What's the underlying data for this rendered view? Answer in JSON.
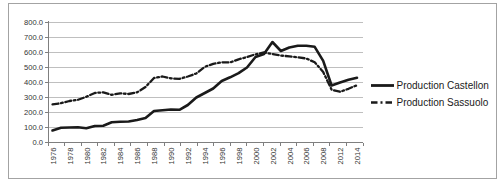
{
  "figure": {
    "background": "#ffffff",
    "border_color": "#a3a3a3"
  },
  "chart_data": {
    "type": "line",
    "title": "",
    "xlabel": "",
    "ylabel": "",
    "ylim": [
      0,
      800
    ],
    "ytick_step": 100,
    "ytick_labels": [
      "0.0",
      "100.0",
      "200.0",
      "300.0",
      "400.0",
      "500.0",
      "600.0",
      "700.0",
      "800.0"
    ],
    "grid": true,
    "legend_position": "right",
    "x_label_interval": 2,
    "categories": [
      "1976",
      "1977",
      "1978",
      "1979",
      "1980",
      "1981",
      "1982",
      "1983",
      "1984",
      "1985",
      "1986",
      "1987",
      "1988",
      "1989",
      "1990",
      "1991",
      "1992",
      "1993",
      "1994",
      "1995",
      "1996",
      "1997",
      "1998",
      "1999",
      "2000",
      "2001",
      "2002",
      "2003",
      "2004",
      "2005",
      "2006",
      "2007",
      "2008",
      "2009",
      "2012",
      "2013",
      "2014"
    ],
    "x_labels_visible": [
      "1976",
      "1978",
      "1980",
      "1982",
      "1984",
      "1986",
      "1988",
      "1990",
      "1992",
      "1994",
      "1996",
      "1998",
      "2000",
      "2002",
      "2004",
      "2006",
      "2008",
      "2012",
      "2014"
    ],
    "series": [
      {
        "name": "Production Castellon",
        "line_style": "solid",
        "color": "#1a1a1a",
        "values": [
          80,
          98,
          100,
          102,
          95,
          110,
          112,
          135,
          138,
          140,
          150,
          163,
          210,
          215,
          220,
          218,
          250,
          300,
          330,
          360,
          410,
          435,
          462,
          500,
          570,
          590,
          670,
          610,
          633,
          645,
          645,
          638,
          545,
          380,
          400,
          418,
          432
        ]
      },
      {
        "name": "Production Sassuolo",
        "line_style": "dash-dot",
        "color": "#1a1a1a",
        "values": [
          255,
          262,
          277,
          285,
          305,
          330,
          335,
          318,
          328,
          323,
          335,
          370,
          430,
          440,
          428,
          424,
          440,
          460,
          505,
          524,
          535,
          533,
          555,
          570,
          588,
          600,
          590,
          580,
          574,
          568,
          560,
          535,
          470,
          352,
          338,
          358,
          382
        ]
      }
    ]
  }
}
